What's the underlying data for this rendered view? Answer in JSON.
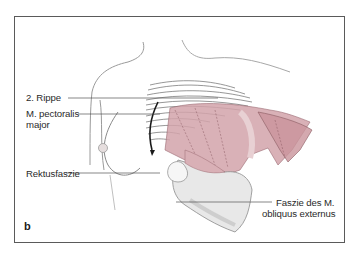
{
  "figure": {
    "panel_letter": "b",
    "labels": {
      "rib": "2. Rippe",
      "pectoralis_line1": "M. pectoralis",
      "pectoralis_line2": "major",
      "rectus": "Rektusfaszie",
      "obliquus_line1": "Faszie des M.",
      "obliquus_line2": "obliquus externus"
    },
    "colors": {
      "frame": "#5a5a5a",
      "muscle": "#c9949b",
      "muscle_light": "#dcb6bb",
      "outline": "#8a8a8a",
      "leader": "#555555"
    }
  }
}
